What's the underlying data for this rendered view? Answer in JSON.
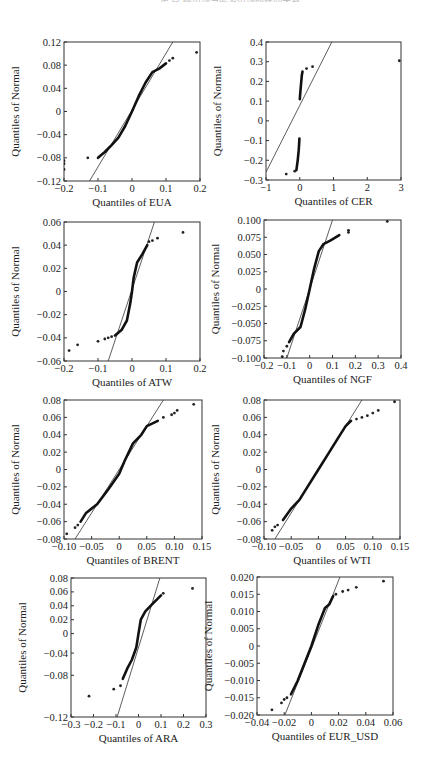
{
  "page": {
    "header_fragment": "第 章  碳市场与能源市场的联动关系"
  },
  "chart_data": [
    {
      "type": "scatter",
      "subtype": "qq-plot",
      "title": "",
      "xlabel": "Quantiles of EUA",
      "ylabel": "Quantiles of Normal",
      "xlim": [
        -0.2,
        0.2
      ],
      "ylim": [
        -0.12,
        0.12
      ],
      "xticks": [
        -0.2,
        -0.1,
        0,
        0.1,
        0.2
      ],
      "xtick_labels": [
        "-0.2",
        "-0.1",
        "0",
        "0.1",
        "0.2"
      ],
      "yticks": [
        0.12,
        0.08,
        0.04,
        0,
        -0.04,
        -0.08,
        -0.12
      ],
      "ytick_labels": [
        "0.12",
        "0.08",
        "0.04",
        "0",
        "-0.04",
        "-0.08",
        "-0.12"
      ],
      "grid": false,
      "reference_line": [
        [
          -0.125,
          -0.12
        ],
        [
          0.12,
          0.12
        ]
      ],
      "curve": [
        [
          -0.1,
          -0.08
        ],
        [
          -0.08,
          -0.07
        ],
        [
          -0.06,
          -0.058
        ],
        [
          -0.04,
          -0.045
        ],
        [
          -0.02,
          -0.025
        ],
        [
          0,
          0
        ],
        [
          0.02,
          0.027
        ],
        [
          0.04,
          0.05
        ],
        [
          0.06,
          0.068
        ],
        [
          0.08,
          0.074
        ],
        [
          0.1,
          0.083
        ]
      ],
      "outliers": [
        [
          -0.2,
          -0.085
        ],
        [
          -0.2,
          -0.09
        ],
        [
          -0.2,
          -0.1
        ],
        [
          -0.13,
          -0.08
        ],
        [
          0.11,
          0.088
        ],
        [
          0.12,
          0.092
        ],
        [
          0.19,
          0.102
        ]
      ],
      "box": {
        "left": 64,
        "top": 42,
        "width": 136,
        "height": 139
      }
    },
    {
      "type": "scatter",
      "subtype": "qq-plot",
      "title": "",
      "xlabel": "Quantiles of CER",
      "ylabel": "Quantiles of Normal",
      "xlim": [
        -1,
        3
      ],
      "ylim": [
        -0.3,
        0.4
      ],
      "xticks": [
        -1,
        0,
        1,
        2,
        3
      ],
      "xtick_labels": [
        "-1",
        "0",
        "1",
        "2",
        "3"
      ],
      "yticks": [
        0.4,
        0.3,
        0.2,
        0.1,
        0,
        -0.1,
        -0.2,
        -0.3
      ],
      "ytick_labels": [
        "0.4",
        "0.3",
        "0.2",
        "0.1",
        "0",
        "-0.1",
        "-0.2",
        "-0.3"
      ],
      "grid": false,
      "reference_line": [
        [
          -1,
          -0.26
        ],
        [
          0.95,
          0.4
        ]
      ],
      "curve_segments": [
        [
          [
            0.0,
            0.11
          ],
          [
            0.02,
            0.15
          ],
          [
            0.04,
            0.19
          ],
          [
            0.06,
            0.23
          ],
          [
            0.08,
            0.25
          ]
        ],
        [
          [
            -0.1,
            -0.25
          ],
          [
            -0.06,
            -0.2
          ],
          [
            -0.03,
            -0.15
          ],
          [
            -0.02,
            -0.12
          ],
          [
            -0.01,
            -0.09
          ]
        ]
      ],
      "outliers": [
        [
          -0.4,
          -0.27
        ],
        [
          -0.15,
          -0.255
        ],
        [
          0.2,
          0.265
        ],
        [
          0.38,
          0.275
        ],
        [
          2.95,
          0.305
        ]
      ],
      "box": {
        "left": 266,
        "top": 42,
        "width": 135,
        "height": 138
      }
    },
    {
      "type": "scatter",
      "subtype": "qq-plot",
      "title": "",
      "xlabel": "Quantiles of ATW",
      "ylabel": "Quantiles of Normal",
      "xlim": [
        -0.2,
        0.2
      ],
      "ylim": [
        -0.06,
        0.06
      ],
      "xticks": [
        -0.2,
        -0.1,
        0,
        0.1,
        0.2
      ],
      "xtick_labels": [
        "-0.2",
        "-0.1",
        "0",
        "0.1",
        "0.2"
      ],
      "yticks": [
        0.06,
        0.04,
        0.02,
        0,
        -0.02,
        -0.04,
        -0.06
      ],
      "ytick_labels": [
        "0.06",
        "0.04",
        "0.02",
        "0",
        "-0.02",
        "-0.04",
        "-0.06"
      ],
      "grid": false,
      "reference_line": [
        [
          -0.07,
          -0.06
        ],
        [
          0.066,
          0.06
        ]
      ],
      "curve": [
        [
          -0.05,
          -0.038
        ],
        [
          -0.03,
          -0.033
        ],
        [
          -0.015,
          -0.025
        ],
        [
          -0.005,
          -0.01
        ],
        [
          0,
          0
        ],
        [
          0.005,
          0.012
        ],
        [
          0.015,
          0.025
        ],
        [
          0.03,
          0.032
        ],
        [
          0.045,
          0.04
        ]
      ],
      "outliers": [
        [
          -0.185,
          -0.051
        ],
        [
          -0.16,
          -0.046
        ],
        [
          -0.1,
          -0.043
        ],
        [
          -0.08,
          -0.041
        ],
        [
          -0.07,
          -0.04
        ],
        [
          -0.06,
          -0.039
        ],
        [
          0.05,
          0.043
        ],
        [
          0.06,
          0.044
        ],
        [
          0.075,
          0.046
        ],
        [
          0.15,
          0.051
        ]
      ],
      "box": {
        "left": 64,
        "top": 222,
        "width": 136,
        "height": 139
      }
    },
    {
      "type": "scatter",
      "subtype": "qq-plot",
      "title": "",
      "xlabel": "Quantiles of NGF",
      "ylabel": "Quantiles of Normal",
      "xlim": [
        -0.2,
        0.4
      ],
      "ylim": [
        -0.1,
        0.1
      ],
      "xticks": [
        -0.2,
        -0.1,
        0,
        0.1,
        0.2,
        0.3,
        0.4
      ],
      "xtick_labels": [
        "-0.2",
        "-0.1",
        "0",
        "0.1",
        "0.2",
        "0.3",
        "0.4"
      ],
      "yticks": [
        0.1,
        0.075,
        0.05,
        0.025,
        0,
        -0.025,
        -0.05,
        -0.075,
        -0.1
      ],
      "ytick_labels": [
        "0.100",
        "0.075",
        "0.050",
        "0.025",
        "0",
        "-0.025",
        "-0.050",
        "-0.075",
        "-0.100"
      ],
      "grid": false,
      "reference_line": [
        [
          -0.1,
          -0.1
        ],
        [
          0.1,
          0.1
        ]
      ],
      "curve": [
        [
          -0.09,
          -0.077
        ],
        [
          -0.07,
          -0.065
        ],
        [
          -0.04,
          -0.055
        ],
        [
          -0.02,
          -0.03
        ],
        [
          0,
          0
        ],
        [
          0.02,
          0.03
        ],
        [
          0.04,
          0.055
        ],
        [
          0.06,
          0.065
        ],
        [
          0.09,
          0.07
        ],
        [
          0.13,
          0.078
        ]
      ],
      "outliers": [
        [
          -0.12,
          -0.098
        ],
        [
          -0.115,
          -0.09
        ],
        [
          -0.1,
          -0.083
        ],
        [
          0.17,
          0.085
        ],
        [
          0.17,
          0.082
        ],
        [
          0.34,
          0.098
        ]
      ],
      "box": {
        "left": 264,
        "top": 220,
        "width": 137,
        "height": 138
      }
    },
    {
      "type": "scatter",
      "subtype": "qq-plot",
      "title": "",
      "xlabel": "Quantiles of BRENT",
      "ylabel": "Quantiles of Normal",
      "xlim": [
        -0.1,
        0.15
      ],
      "ylim": [
        -0.08,
        0.08
      ],
      "xticks": [
        -0.1,
        -0.05,
        0,
        0.05,
        0.1,
        0.15
      ],
      "xtick_labels": [
        "-0.10",
        "-0.05",
        "0",
        "0.05",
        "0.10",
        "0.15"
      ],
      "yticks": [
        0.08,
        0.06,
        0.04,
        0.02,
        0,
        -0.02,
        -0.04,
        -0.06,
        -0.08
      ],
      "ytick_labels": [
        "0.08",
        "0.06",
        "0.04",
        "0.02",
        "0",
        "-0.02",
        "-0.04",
        "-0.06",
        "-0.08"
      ],
      "grid": false,
      "reference_line": [
        [
          -0.08,
          -0.08
        ],
        [
          0.08,
          0.08
        ]
      ],
      "curve": [
        [
          -0.07,
          -0.06
        ],
        [
          -0.06,
          -0.05
        ],
        [
          -0.04,
          -0.04
        ],
        [
          -0.02,
          -0.023
        ],
        [
          0,
          -0.005
        ],
        [
          0.01,
          0.01
        ],
        [
          0.025,
          0.03
        ],
        [
          0.04,
          0.04
        ],
        [
          0.05,
          0.05
        ],
        [
          0.07,
          0.056
        ]
      ],
      "outliers": [
        [
          -0.095,
          -0.074
        ],
        [
          -0.08,
          -0.067
        ],
        [
          -0.075,
          -0.064
        ],
        [
          0.08,
          0.06
        ],
        [
          0.095,
          0.063
        ],
        [
          0.1,
          0.065
        ],
        [
          0.105,
          0.068
        ],
        [
          0.135,
          0.075
        ]
      ],
      "box": {
        "left": 64,
        "top": 400,
        "width": 138,
        "height": 139
      }
    },
    {
      "type": "scatter",
      "subtype": "qq-plot",
      "title": "",
      "xlabel": "Quantiles of WTI",
      "ylabel": "Quantiles of Normal",
      "xlim": [
        -0.1,
        0.15
      ],
      "ylim": [
        -0.08,
        0.08
      ],
      "xticks": [
        -0.1,
        -0.05,
        0,
        0.05,
        0.1,
        0.15
      ],
      "xtick_labels": [
        "-0.10",
        "-0.05",
        "0",
        "0.05",
        "0.10",
        "0.15"
      ],
      "yticks": [
        0.08,
        0.06,
        0.04,
        0.02,
        0,
        -0.02,
        -0.04,
        -0.06,
        -0.08
      ],
      "ytick_labels": [
        "0.08",
        "0.06",
        "0.04",
        "0.02",
        "0",
        "-0.02",
        "-0.04",
        "-0.06",
        "-0.08"
      ],
      "grid": false,
      "reference_line": [
        [
          -0.08,
          -0.08
        ],
        [
          0.08,
          0.08
        ]
      ],
      "curve": [
        [
          -0.065,
          -0.058
        ],
        [
          -0.05,
          -0.045
        ],
        [
          -0.035,
          -0.035
        ],
        [
          -0.02,
          -0.02
        ],
        [
          0,
          0
        ],
        [
          0.02,
          0.02
        ],
        [
          0.035,
          0.035
        ],
        [
          0.05,
          0.05
        ],
        [
          0.06,
          0.056
        ]
      ],
      "outliers": [
        [
          -0.085,
          -0.07
        ],
        [
          -0.08,
          -0.066
        ],
        [
          -0.075,
          -0.064
        ],
        [
          0.07,
          0.058
        ],
        [
          0.08,
          0.06
        ],
        [
          0.09,
          0.062
        ],
        [
          0.1,
          0.065
        ],
        [
          0.11,
          0.068
        ],
        [
          0.14,
          0.078
        ]
      ],
      "box": {
        "left": 264,
        "top": 400,
        "width": 136,
        "height": 139
      }
    },
    {
      "type": "scatter",
      "subtype": "qq-plot",
      "title": "",
      "xlabel": "Quantiles of ARA",
      "ylabel": "Quantiles of Normal",
      "xlim": [
        -0.3,
        0.3
      ],
      "ylim": [
        -0.12,
        0.08
      ],
      "xticks": [
        -0.3,
        -0.2,
        -0.1,
        0,
        0.1,
        0.2,
        0.3
      ],
      "xtick_labels": [
        "-0.3",
        "-0.2",
        "-0.1",
        "0",
        "0.1",
        "0.2",
        "0.3"
      ],
      "yticks": [
        0.08,
        0.06,
        0.04,
        0.02,
        0,
        -0.04,
        -0.08,
        -0.12
      ],
      "ytick_labels": [
        "0.08",
        "0.06",
        "0.04",
        "0.02",
        "0",
        "-0.04",
        "-0.08",
        "-0.12"
      ],
      "ytick_positions": [
        0.08,
        0.06,
        0.04,
        0.02,
        0,
        -0.028,
        -0.06,
        -0.12
      ],
      "grid": false,
      "reference_line": [
        [
          -0.095,
          -0.12
        ],
        [
          0.095,
          0.08
        ]
      ],
      "curve": [
        [
          -0.07,
          -0.065
        ],
        [
          -0.05,
          -0.05
        ],
        [
          -0.03,
          -0.038
        ],
        [
          -0.01,
          -0.02
        ],
        [
          0,
          0
        ],
        [
          0.01,
          0.02
        ],
        [
          0.03,
          0.032
        ],
        [
          0.06,
          0.042
        ],
        [
          0.1,
          0.055
        ]
      ],
      "outliers": [
        [
          -0.22,
          -0.09
        ],
        [
          -0.11,
          -0.08
        ],
        [
          -0.08,
          -0.075
        ],
        [
          0.11,
          0.058
        ],
        [
          0.24,
          0.065
        ]
      ],
      "box": {
        "left": 71,
        "top": 578,
        "width": 135,
        "height": 139
      }
    },
    {
      "type": "scatter",
      "subtype": "qq-plot",
      "title": "",
      "xlabel": "Quantiles of EUR_USD",
      "ylabel": "Quantiles of Normal",
      "xlim": [
        -0.04,
        0.06
      ],
      "ylim": [
        -0.02,
        0.02
      ],
      "xticks": [
        -0.04,
        -0.02,
        0,
        0.02,
        0.04,
        0.06
      ],
      "xtick_labels": [
        "-0.04",
        "-0.02",
        "0",
        "0.02",
        "0.04",
        "0.06"
      ],
      "yticks": [
        0.02,
        0.015,
        0.01,
        0.005,
        0,
        -0.005,
        -0.01,
        -0.015,
        -0.02
      ],
      "ytick_labels": [
        "0.020",
        "0.015",
        "0.010",
        "0.005",
        "0",
        "-0.005",
        "-0.010",
        "-0.015",
        "-0.020"
      ],
      "grid": false,
      "reference_line": [
        [
          -0.0195,
          -0.02
        ],
        [
          0.021,
          0.02
        ]
      ],
      "curve": [
        [
          -0.015,
          -0.014
        ],
        [
          -0.01,
          -0.01
        ],
        [
          -0.005,
          -0.005
        ],
        [
          0,
          0
        ],
        [
          0.005,
          0.006
        ],
        [
          0.01,
          0.011
        ],
        [
          0.013,
          0.012
        ],
        [
          0.016,
          0.0145
        ]
      ],
      "outliers": [
        [
          -0.029,
          -0.0185
        ],
        [
          -0.022,
          -0.0165
        ],
        [
          -0.02,
          -0.0155
        ],
        [
          -0.018,
          -0.015
        ],
        [
          0.018,
          0.015
        ],
        [
          0.023,
          0.0158
        ],
        [
          0.027,
          0.0162
        ],
        [
          0.033,
          0.017
        ],
        [
          0.053,
          0.0188
        ]
      ],
      "box": {
        "left": 257,
        "top": 577,
        "width": 136,
        "height": 138
      }
    }
  ]
}
